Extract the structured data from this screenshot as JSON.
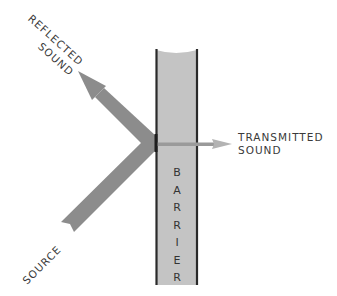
{
  "diagram": {
    "title": "",
    "labels": {
      "reflected_line1": "REFLECTED",
      "reflected_line2": "SOUND",
      "transmitted_line1": "TRANSMITTED",
      "transmitted_line2": "SOUND",
      "source": "SOURCE",
      "barrier_letters": [
        "B",
        "A",
        "R",
        "R",
        "I",
        "E",
        "R"
      ]
    },
    "colors": {
      "arrow": "#8c8c8c",
      "transmitted_arrow": "#b3b3b3",
      "barrier_fill": "#c4c4c4",
      "barrier_edge": "#2a2a2a",
      "text": "#3a3a3a"
    },
    "nodes": [
      {
        "id": "source",
        "label": "SOURCE",
        "type": "incident-arrow"
      },
      {
        "id": "barrier",
        "label": "BARRIER",
        "type": "wall"
      },
      {
        "id": "reflected",
        "label": "REFLECTED SOUND",
        "type": "reflected-arrow"
      },
      {
        "id": "transmitted",
        "label": "TRANSMITTED SOUND",
        "type": "transmitted-arrow"
      }
    ],
    "edges": [
      {
        "from": "source",
        "to": "barrier"
      },
      {
        "from": "barrier",
        "to": "reflected"
      },
      {
        "from": "barrier",
        "to": "transmitted"
      }
    ]
  }
}
